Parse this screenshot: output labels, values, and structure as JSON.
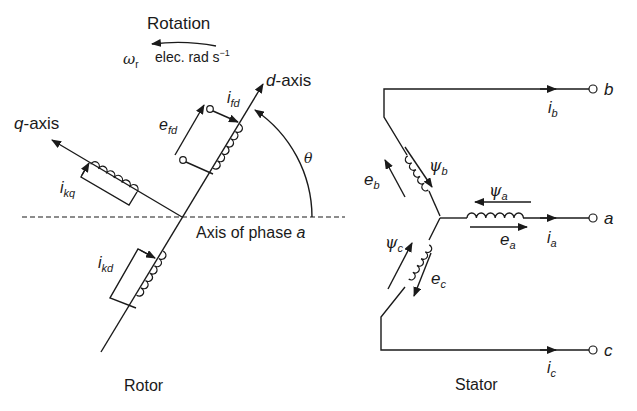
{
  "rotor": {
    "title": "Rotor",
    "rotation_label": "Rotation",
    "omega_symbol": "ω",
    "omega_sub": "r",
    "speed_unit": "elec. rad s",
    "speed_unit_exp": "−1",
    "d_axis_prefix": "d",
    "d_axis_suffix": "-axis",
    "q_axis_prefix": "q",
    "q_axis_suffix": "-axis",
    "phase_axis_text": "Axis of phase ",
    "phase_axis_var": "a",
    "angle_symbol": "θ",
    "field_voltage": {
      "main": "e",
      "sub": "fd"
    },
    "field_current": {
      "main": "i",
      "sub": "fd"
    },
    "q_damper_current": {
      "main": "i",
      "sub": "kq"
    },
    "d_damper_current": {
      "main": "i",
      "sub": "kd"
    }
  },
  "stator": {
    "title": "Stator",
    "terminals": [
      {
        "name": "b",
        "current": {
          "main": "i",
          "sub": "b"
        }
      },
      {
        "name": "a",
        "current": {
          "main": "i",
          "sub": "a"
        }
      },
      {
        "name": "c",
        "current": {
          "main": "i",
          "sub": "c"
        }
      }
    ],
    "phase_a": {
      "emf": {
        "main": "e",
        "sub": "a"
      },
      "flux": {
        "main": "ψ",
        "sub": "a"
      }
    },
    "phase_b": {
      "emf": {
        "main": "e",
        "sub": "b"
      },
      "flux": {
        "main": "ψ",
        "sub": "b"
      }
    },
    "phase_c": {
      "emf": {
        "main": "e",
        "sub": "c"
      },
      "flux": {
        "main": "ψ",
        "sub": "c"
      }
    }
  }
}
